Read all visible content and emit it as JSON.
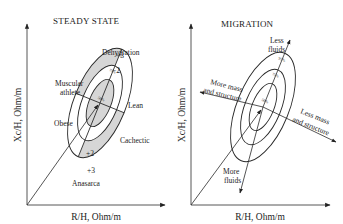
{
  "panels": [
    {
      "id": "steady-state",
      "title": "STEADY STATE",
      "x_axis_label": "R/H, Ohm/m",
      "y_axis_label": "Xc/H, Ohm/m",
      "ellipse_labels": [
        "50%",
        "75%",
        "95%"
      ],
      "tick_labels": {
        "minus3": "−3",
        "minus2": "−2",
        "plus2": "+2",
        "plus3": "+3"
      },
      "region_labels": {
        "dehydration": "Dehydration",
        "muscular_line1": "Muscular",
        "muscular_line2": "athlete",
        "lean": "Lean",
        "obese": "Obese",
        "cachectic": "Cachectic",
        "anasarca": "Anasarca"
      }
    },
    {
      "id": "migration",
      "title": "MIGRATION",
      "x_axis_label": "R/H, Ohm/m",
      "y_axis_label": "Xc/H, Ohm/m",
      "ellipse_labels": [
        "50%",
        "75%",
        "95%"
      ],
      "arrow_labels": {
        "less_fluids_line1": "Less",
        "less_fluids_line2": "fluids",
        "more_fluids_line1": "More",
        "more_fluids_line2": "fluids",
        "more_mass_line1": "More mass",
        "more_mass_line2": "and structure",
        "less_mass_line1": "Less mass",
        "less_mass_line2": "and structure"
      }
    }
  ],
  "colors": {
    "line": "#2a2a2a",
    "shade": "#d9d9d9",
    "axis": "#555555"
  }
}
